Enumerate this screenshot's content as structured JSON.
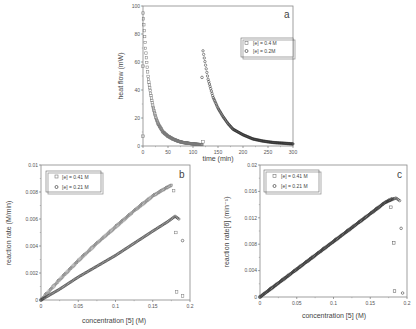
{
  "figure": {
    "panels": [
      "a",
      "b",
      "c"
    ]
  },
  "chart_data": [
    {
      "panel": "a",
      "type": "scatter",
      "title": "",
      "xlabel": "time (min)",
      "ylabel": "heat flow (mW)",
      "xlim": [
        0,
        300
      ],
      "ylim": [
        0,
        100
      ],
      "xticks": [
        "0",
        "50",
        "100",
        "150",
        "200",
        "250",
        "300"
      ],
      "yticks": [
        "0",
        "20",
        "40",
        "60",
        "80",
        "100"
      ],
      "legend": [
        "[e] = 0.4 M",
        "[e] = 0.2M"
      ],
      "legend_position": "upper right",
      "series": [
        {
          "name": "[e] = 0.4 M",
          "marker": "square",
          "color": "#777777",
          "x": [
            0,
            2,
            5,
            10,
            15,
            20,
            25,
            30,
            40,
            50,
            60,
            70,
            80,
            90,
            100,
            110,
            118
          ],
          "y": [
            95,
            85,
            70,
            50,
            38,
            28,
            21,
            16,
            10,
            7,
            5,
            3.5,
            2.5,
            2,
            1.5,
            1.2,
            1
          ],
          "outliers": [
            [
              0,
              57
            ],
            [
              0,
              7
            ],
            [
              120,
              3
            ]
          ]
        },
        {
          "name": "[e] = 0.2M",
          "marker": "circle",
          "color": "#222222",
          "x": [
            120,
            125,
            130,
            140,
            150,
            160,
            170,
            180,
            200,
            220,
            240,
            260,
            280,
            300
          ],
          "y": [
            68,
            58,
            48,
            35,
            27,
            21,
            16,
            12,
            8,
            5,
            3.5,
            2.5,
            2,
            1.5
          ],
          "outliers": [
            [
              118,
              49
            ]
          ]
        }
      ]
    },
    {
      "panel": "b",
      "type": "scatter",
      "title": "",
      "xlabel": "concentration [5]  (M)",
      "ylabel": "reaction rate  (M/min)",
      "xlim": [
        0,
        0.2
      ],
      "ylim": [
        0,
        0.01
      ],
      "xticks": [
        "0",
        "0.05",
        "0.1",
        "0.15",
        "0.2"
      ],
      "yticks": [
        "0",
        "0.002",
        "0.004",
        "0.006",
        "0.008",
        "0.01"
      ],
      "legend": [
        "[e] = 0.41 M",
        "[e] = 0.21 M"
      ],
      "legend_position": "upper left",
      "series": [
        {
          "name": "[e] = 0.41 M",
          "marker": "square",
          "color": "#777777",
          "x": [
            0,
            0.025,
            0.05,
            0.075,
            0.1,
            0.125,
            0.15,
            0.165,
            0.175
          ],
          "y": [
            0,
            0.0015,
            0.0029,
            0.0042,
            0.0054,
            0.0066,
            0.0077,
            0.0082,
            0.0085
          ],
          "outliers": [
            [
              0.178,
              0.0081
            ],
            [
              0.181,
              0.005
            ],
            [
              0.182,
              0.0006
            ],
            [
              0.19,
              0.0003
            ]
          ]
        },
        {
          "name": "[e] = 0.21 M",
          "marker": "circle",
          "color": "#222222",
          "x": [
            0,
            0.025,
            0.05,
            0.075,
            0.1,
            0.125,
            0.15,
            0.17,
            0.18,
            0.185
          ],
          "y": [
            0,
            0.0008,
            0.0017,
            0.0025,
            0.0033,
            0.0042,
            0.0051,
            0.0058,
            0.0062,
            0.006
          ],
          "outliers": [
            [
              0.19,
              0.0044
            ]
          ]
        }
      ]
    },
    {
      "panel": "c",
      "type": "scatter",
      "title": "",
      "xlabel": "concentration [5]  (M)",
      "ylabel": "reaction rate[6]  (min⁻¹)",
      "xlim": [
        0,
        0.2
      ],
      "ylim": [
        0,
        0.02
      ],
      "xticks": [
        "0",
        "0.05",
        "0.1",
        "0.15",
        "0.2"
      ],
      "yticks": [
        "0",
        "0.004",
        "0.008",
        "0.012",
        "0.016",
        "0.02"
      ],
      "legend": [
        "[e] = 0.41 M",
        "[e] = 0.21 M"
      ],
      "legend_position": "upper left",
      "series": [
        {
          "name": "[e] = 0.41 M",
          "marker": "square",
          "color": "#555555",
          "x": [
            0,
            0.025,
            0.05,
            0.075,
            0.1,
            0.125,
            0.15,
            0.17,
            0.18
          ],
          "y": [
            0,
            0.0021,
            0.0042,
            0.0063,
            0.0084,
            0.0105,
            0.0126,
            0.0143,
            0.0149
          ],
          "outliers": [
            [
              0.178,
              0.0136
            ],
            [
              0.182,
              0.0082
            ],
            [
              0.183,
              0.0009
            ]
          ]
        },
        {
          "name": "[e] = 0.21 M",
          "marker": "circle",
          "color": "#222222",
          "x": [
            0,
            0.025,
            0.05,
            0.075,
            0.1,
            0.125,
            0.15,
            0.17,
            0.185,
            0.19
          ],
          "y": [
            0,
            0.0021,
            0.0042,
            0.0063,
            0.0084,
            0.0105,
            0.0126,
            0.0143,
            0.015,
            0.0146
          ],
          "outliers": [
            [
              0.192,
              0.0104
            ],
            [
              0.194,
              0.0006
            ]
          ]
        }
      ]
    }
  ],
  "labels": {
    "a": {
      "panel": "a",
      "xlabel": "time (min)",
      "ylabel": "heat flow (mW)",
      "legend0": "[e] = 0.4 M",
      "legend1": "[e] = 0.2M",
      "xticks": [
        "0",
        "50",
        "100",
        "150",
        "200",
        "250",
        "300"
      ],
      "yticks": [
        "0",
        "20",
        "40",
        "60",
        "80",
        "100"
      ]
    },
    "b": {
      "panel": "b",
      "xlabel": "concentration [5]  (M)",
      "ylabel": "reaction rate  (M/min)",
      "legend0": "[e] = 0.41 M",
      "legend1": "[e] = 0.21 M",
      "xticks": [
        "0",
        "0.05",
        "0.1",
        "0.15",
        "0.2"
      ],
      "yticks": [
        "0",
        "0.002",
        "0.004",
        "0.006",
        "0.008",
        "0.01"
      ]
    },
    "c": {
      "panel": "c",
      "xlabel": "concentration [5]  (M)",
      "ylabel": "reaction rate[6]  (min⁻¹)",
      "legend0": "[e] = 0.41 M",
      "legend1": "[e] = 0.21 M",
      "xticks": [
        "0",
        "0.05",
        "0.1",
        "0.15",
        "0.2"
      ],
      "yticks": [
        "0",
        "0.004",
        "0.008",
        "0.012",
        "0.016",
        "0.02"
      ]
    }
  }
}
